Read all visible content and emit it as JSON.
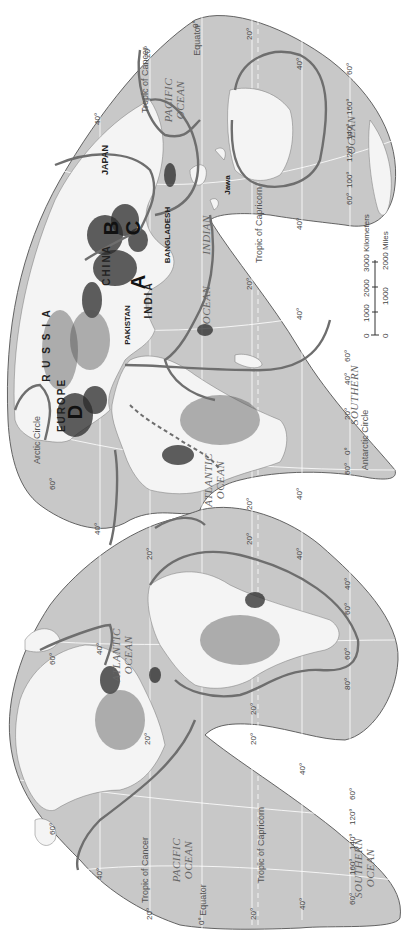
{
  "map": {
    "type": "world population distribution map",
    "projection": "interrupted Goode homolosine",
    "orientation": "rotated 90 degrees counter-clockwise (north to the left)",
    "region_markers": [
      "A",
      "B",
      "C",
      "D"
    ],
    "country_labels": {
      "russia": "R U S S I A",
      "china": "CHINA",
      "india": "INDIA",
      "pakistan": "PAKISTAN",
      "bangladesh": "BANGLADESH",
      "japan": "JAPAN",
      "europe": "EUROPE",
      "jawa": "Jawa"
    },
    "ocean_labels": {
      "pacific_east": [
        "PACIFIC",
        "OCEAN"
      ],
      "pacific_west": [
        "PACIFIC",
        "OCEAN"
      ],
      "atlantic_north": [
        "ATLANTIC",
        "OCEAN"
      ],
      "atlantic_south": [
        "ATLANTIC",
        "OCEAN"
      ],
      "indian": [
        "INDIAN",
        "OCEAN"
      ],
      "southern_east": [
        "SOUTHERN"
      ],
      "southern_west": [
        "SOUTHERN",
        "OCEAN"
      ],
      "southern_oz": [
        "OCEAN"
      ]
    },
    "lines": {
      "equator": "Equator",
      "tropic_cancer": "Tropic of Cancer",
      "tropic_capricorn": "Tropic of Capricorn",
      "arctic": "Arctic Circle",
      "antarctic": "Antarctic Circle"
    },
    "degree_labels": {
      "lat": [
        "0°",
        "20°",
        "40°",
        "60°"
      ],
      "lon": [
        "0°",
        "20°",
        "40°",
        "60°",
        "80°",
        "100°",
        "120°",
        "140°",
        "160°"
      ]
    },
    "scale_bar": {
      "km_ticks": [
        "0",
        "1000",
        "2000",
        "3000 Kilometers"
      ],
      "mi_ticks": [
        "0",
        "1000",
        "2000 Miles"
      ]
    }
  }
}
